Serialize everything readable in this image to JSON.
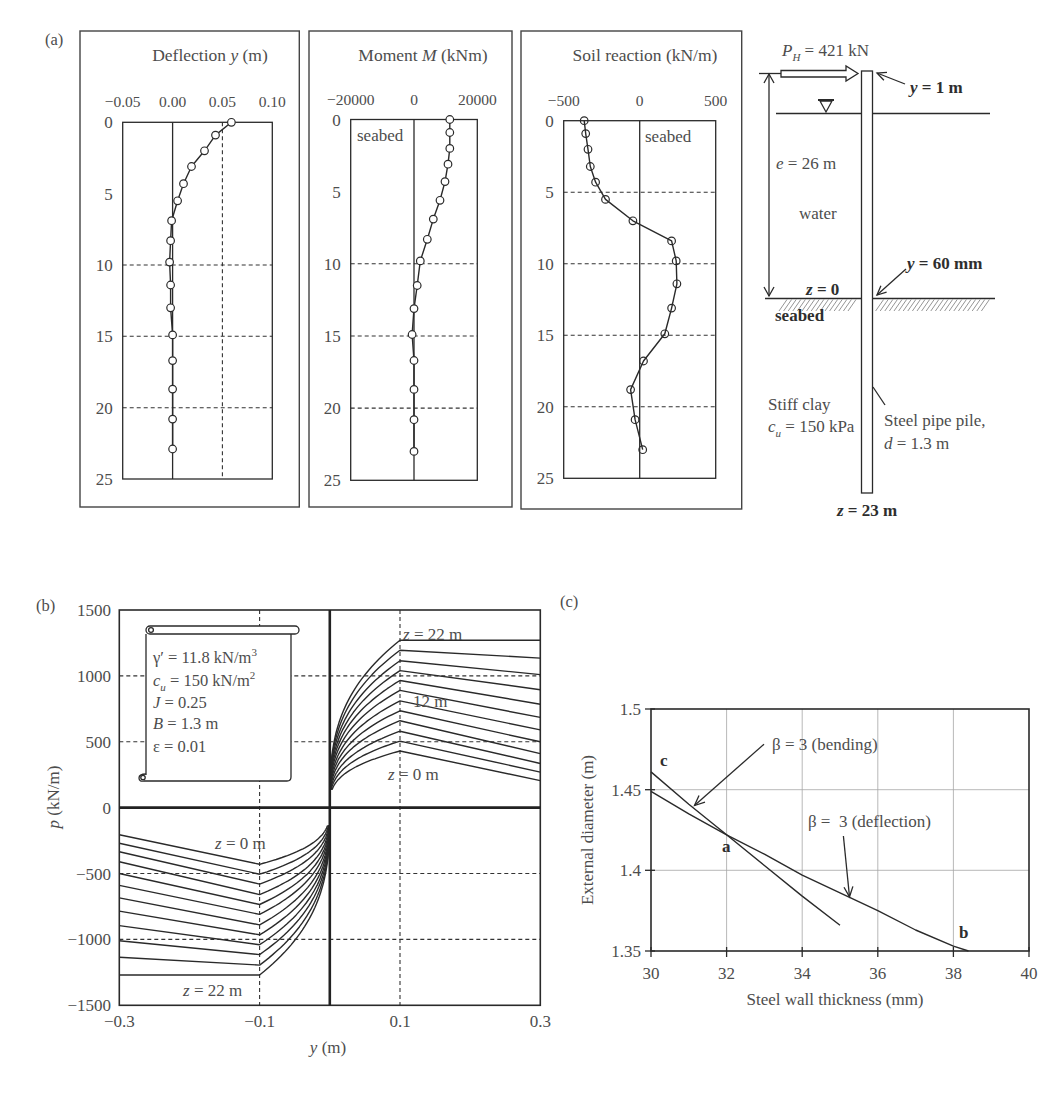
{
  "figure": {
    "panel_labels": {
      "a": "(a)",
      "b": "(b)",
      "c": "(c)"
    }
  },
  "chart_data": [
    {
      "type": "line",
      "title": "Deflection y (m)",
      "title_parts": [
        "Deflection ",
        "y",
        " (m)"
      ],
      "xlim": [
        -0.05,
        0.1
      ],
      "xticks": [
        -0.05,
        0.0,
        0.05,
        0.1
      ],
      "xtick_labels": [
        "−0.05",
        "0.00",
        "0.05",
        "0.10"
      ],
      "ylim": [
        0,
        25
      ],
      "y_inverted": true,
      "yticks": [
        0,
        5,
        10,
        15,
        20,
        25
      ],
      "ytick_labels": [
        "0",
        "5",
        "10",
        "15",
        "20",
        "25"
      ],
      "grid": {
        "dashed_y": [
          10,
          15,
          20
        ],
        "dashed_x": [
          0.05
        ],
        "solid_x": [
          0.0
        ]
      },
      "annotations": [],
      "series": [
        {
          "name": "Deflection",
          "marker_fill": "#ffffff",
          "z": [
            0,
            0.9,
            2.0,
            3.1,
            4.3,
            5.5,
            6.9,
            8.3,
            9.8,
            11.4,
            13.0,
            14.9,
            16.7,
            18.7,
            20.8,
            22.9
          ],
          "values": [
            0.059,
            0.043,
            0.032,
            0.019,
            0.011,
            0.005,
            -0.001,
            -0.002,
            -0.003,
            -0.002,
            -0.002,
            0.0,
            0.0,
            0.0,
            0.0,
            0.0
          ]
        }
      ]
    },
    {
      "type": "line",
      "title": "Moment M (kNm)",
      "title_parts": [
        "Moment ",
        "M",
        " (kNm)"
      ],
      "xlim": [
        -20000,
        20000
      ],
      "xticks": [
        -20000,
        0,
        20000
      ],
      "xtick_labels": [
        "−20000",
        "0",
        "20000"
      ],
      "ylim": [
        0,
        25
      ],
      "y_inverted": true,
      "yticks": [
        0,
        5,
        10,
        15,
        20,
        25
      ],
      "ytick_labels": [
        "0",
        "5",
        "10",
        "15",
        "20",
        "25"
      ],
      "grid": {
        "dashed_y": [
          10,
          15,
          20
        ],
        "dashed_x": [],
        "solid_x": [
          0
        ]
      },
      "annotations": [
        {
          "text": "seabed",
          "x": -18000,
          "z": 1.15
        }
      ],
      "series": [
        {
          "name": "Moment",
          "marker_fill": "#ffffff",
          "z": [
            0,
            0.9,
            2.0,
            3.1,
            4.3,
            5.6,
            6.9,
            8.3,
            9.8,
            11.5,
            13.1,
            14.9,
            16.7,
            18.7,
            20.8,
            23.0
          ],
          "values": [
            11300,
            11300,
            11300,
            10750,
            9800,
            8200,
            6100,
            4200,
            2000,
            1000,
            0,
            -600,
            0,
            0,
            0,
            0
          ]
        }
      ]
    },
    {
      "type": "line",
      "title": "Soil reaction (kN/m)",
      "title_parts": [
        "Soil reaction (kN/m)",
        "",
        ""
      ],
      "xlim": [
        -500,
        500
      ],
      "xticks": [
        -500,
        0,
        500
      ],
      "xtick_labels": [
        "−500",
        "0",
        "500"
      ],
      "ylim": [
        0,
        25
      ],
      "y_inverted": true,
      "yticks": [
        0,
        5,
        10,
        15,
        20,
        25
      ],
      "ytick_labels": [
        "0",
        "5",
        "10",
        "15",
        "20",
        "25"
      ],
      "grid": {
        "dashed_y": [
          5,
          10,
          15,
          20
        ],
        "dashed_x": [],
        "solid_x": [
          0
        ]
      },
      "annotations": [
        {
          "text": "seabed",
          "x": 35,
          "z": 1.17
        }
      ],
      "series": [
        {
          "name": "Soil reaction",
          "marker_fill": "none",
          "z": [
            0,
            0.9,
            2.0,
            3.2,
            4.3,
            5.5,
            7.0,
            8.4,
            9.8,
            11.4,
            13.1,
            14.9,
            16.8,
            18.8,
            20.9,
            23.0
          ],
          "values": [
            -365,
            -355,
            -340,
            -325,
            -290,
            -225,
            -45,
            210,
            240,
            245,
            210,
            165,
            25,
            -60,
            -30,
            20
          ]
        }
      ]
    },
    {
      "type": "line",
      "xlabel_parts": [
        "y",
        " (m)"
      ],
      "ylabel_parts": [
        "p",
        " (kN/m)"
      ],
      "xlim": [
        -0.3,
        0.3
      ],
      "ylim": [
        -1500,
        1500
      ],
      "xticks": [
        -0.3,
        -0.1,
        0.1,
        0.3
      ],
      "xtick_labels": [
        "−0.3",
        "−0.1",
        "0.1",
        "0.3"
      ],
      "yticks": [
        1500,
        1000,
        500,
        0,
        -500,
        -1000,
        -1500
      ],
      "ytick_labels": [
        "1500",
        "1000",
        "500",
        "0",
        "−500",
        "−1000",
        "−1500"
      ],
      "grid": {
        "dashed_x": [
          -0.1,
          0.1
        ],
        "dashed_y": [
          -1000,
          -500,
          500,
          1000
        ],
        "thick_x": [
          0
        ],
        "thick_y": [
          0
        ]
      },
      "y_peak": 0.1,
      "p_start": 135,
      "curve_shape": "p = p_peak·(|y|/0.1)^(1/3) up to |y| = 0.1, then linear to p_end at |y| = 0.3; antisymmetric for y < 0",
      "series": [
        {
          "name": "z = 0 m",
          "z": 0,
          "p_peak": 430,
          "p_end": 205
        },
        {
          "name": "z = 2 m",
          "z": 2,
          "p_peak": 505,
          "p_end": 270
        },
        {
          "name": "z = 4 m",
          "z": 4,
          "p_peak": 580,
          "p_end": 335
        },
        {
          "name": "z = 6 m",
          "z": 6,
          "p_peak": 660,
          "p_end": 410
        },
        {
          "name": "z = 8 m",
          "z": 8,
          "p_peak": 735,
          "p_end": 500
        },
        {
          "name": "z = 10 m",
          "z": 10,
          "p_peak": 810,
          "p_end": 590
        },
        {
          "name": "z = 12 m",
          "z": 12,
          "p_peak": 890,
          "p_end": 685
        },
        {
          "name": "z = 14 m",
          "z": 14,
          "p_peak": 965,
          "p_end": 785
        },
        {
          "name": "z = 16 m",
          "z": 16,
          "p_peak": 1040,
          "p_end": 895
        },
        {
          "name": "z = 18 m",
          "z": 18,
          "p_peak": 1115,
          "p_end": 1010
        },
        {
          "name": "z = 20 m",
          "z": 20,
          "p_peak": 1195,
          "p_end": 1135
        },
        {
          "name": "z = 22 m",
          "z": 22,
          "p_peak": 1270,
          "p_end": 1270
        }
      ],
      "curve_labels": {
        "pos_top": {
          "symbol": "z",
          "value": " = 22 m"
        },
        "pos_mid": "12 m",
        "pos_bottom": {
          "symbol": "z",
          "value": " = 0 m"
        },
        "neg_top": {
          "symbol": "z",
          "value": " = 0 m"
        },
        "neg_bottom": {
          "symbol": "z",
          "value": " = 22 m"
        }
      },
      "legend_box": {
        "gamma": {
          "symbol": "γ′",
          "value": " = 11.8 kN/m",
          "sup": "3"
        },
        "cu": {
          "symbol": "c",
          "sub": "u",
          "value": " = 150 kN/m",
          "sup": "2"
        },
        "J": {
          "symbol": "J",
          "value": " = 0.25"
        },
        "B": {
          "symbol": "B",
          "value": " = 1.3 m"
        },
        "eps": {
          "symbol": "ε",
          "value": " = 0.01"
        }
      }
    },
    {
      "type": "line",
      "xlabel": "Steel wall thickness (mm)",
      "ylabel": "External diameter (m)",
      "xlim": [
        30,
        40
      ],
      "ylim": [
        1.35,
        1.5
      ],
      "xticks": [
        30,
        32,
        34,
        36,
        38,
        40
      ],
      "xtick_labels": [
        "30",
        "32",
        "34",
        "36",
        "38",
        "40"
      ],
      "yticks": [
        1.5,
        1.45,
        1.4,
        1.35
      ],
      "ytick_labels": [
        "1.5",
        "1.45",
        "1.4",
        "1.35"
      ],
      "grid": {
        "x": [
          32,
          34,
          36,
          38
        ],
        "y": [
          1.45,
          1.4
        ]
      },
      "series": [
        {
          "name": "β = 3 (bending)",
          "x": [
            30,
            31,
            32,
            33,
            34,
            35
          ],
          "y": [
            1.461,
            1.441,
            1.422,
            1.403,
            1.384,
            1.366
          ]
        },
        {
          "name": "β = 3 (deflection)",
          "x": [
            30,
            31,
            32,
            33,
            34,
            35,
            36,
            37,
            38,
            38.4
          ],
          "y": [
            1.449,
            1.435,
            1.422,
            1.41,
            1.397,
            1.386,
            1.375,
            1.363,
            1.353,
            1.35
          ]
        }
      ],
      "annotations": [
        {
          "text": "c",
          "x": 30.24,
          "y": 1.4647
        },
        {
          "text": "a",
          "x": 31.88,
          "y": 1.4113
        },
        {
          "text": "b",
          "x": 38.15,
          "y": 1.358
        }
      ],
      "callouts": [
        {
          "text": "β = 3 (bending)",
          "text_x": 33.2,
          "text_y": 1.4746,
          "line_from": [
            32.99,
            1.4782
          ],
          "arrow_to": [
            31.15,
            1.4402
          ]
        },
        {
          "text": "β =  3 (deflection)",
          "text_x": 34.15,
          "text_y": 1.427,
          "line_from": [
            35.09,
            1.4213
          ],
          "arrow_to": [
            35.25,
            1.3836
          ]
        }
      ]
    }
  ],
  "pile_diagram": {
    "load": {
      "symbol": "P",
      "subscript": "H",
      "value": " = 421 kN"
    },
    "head_deflection": {
      "symbol": "y",
      "value": " = 1 m"
    },
    "free_length": {
      "symbol": "e",
      "value": " = 26 m"
    },
    "water_label": "water",
    "mudline_deflection": {
      "symbol": "y",
      "value": " = 60 mm"
    },
    "mudline_depth": {
      "symbol": "z",
      "value": " = 0"
    },
    "seabed_label": "seabed",
    "soil": {
      "name": "Stiff clay",
      "symbol": "c",
      "subscript": "u",
      "value": " = 150 kPa"
    },
    "pile": {
      "name": "Steel pipe pile,",
      "symbol": "d",
      "value": " = 1.3 m"
    },
    "tip_depth": {
      "symbol": "z",
      "value": " = 23 m"
    }
  }
}
